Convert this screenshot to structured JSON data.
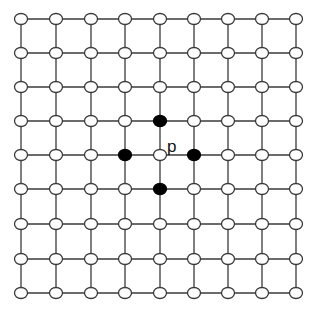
{
  "diagram": {
    "title": "",
    "grid": {
      "columns": 9,
      "rows": 9,
      "x_positions": [
        21,
        56,
        91,
        125,
        160,
        194,
        228,
        262,
        296
      ],
      "y_positions": [
        19,
        53,
        87,
        121,
        155,
        189,
        224,
        259,
        293
      ]
    },
    "center_node": {
      "col": 4,
      "row": 4,
      "label": "p"
    },
    "filled_nodes": [
      {
        "col": 4,
        "row": 3
      },
      {
        "col": 3,
        "row": 4
      },
      {
        "col": 5,
        "row": 4
      },
      {
        "col": 4,
        "row": 5
      }
    ],
    "colors": {
      "line": "#3a3a3a",
      "empty_node_fill": "#ffffff",
      "filled_node_fill": "#000000"
    }
  }
}
